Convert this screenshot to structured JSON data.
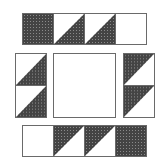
{
  "diagram": {
    "type": "quilt-block-layout",
    "colors": {
      "dark": "#444444",
      "dot": "#8a8a8a",
      "light": "#ffffff",
      "outline": "#6a6a6a"
    },
    "top_row": {
      "cells": [
        "full-dark",
        "dark-bottom-right",
        "dark-bottom-right",
        "plain"
      ]
    },
    "left_column": {
      "cells": [
        "dark-bottom-right",
        "dark-bottom-right"
      ]
    },
    "center": {
      "cells": [
        "plain-large"
      ]
    },
    "right_column": {
      "cells": [
        "dark-top-left",
        "dark-top-left"
      ]
    },
    "bottom_row": {
      "cells": [
        "plain",
        "dark-top-left",
        "dark-top-left",
        "full-dark"
      ]
    }
  }
}
